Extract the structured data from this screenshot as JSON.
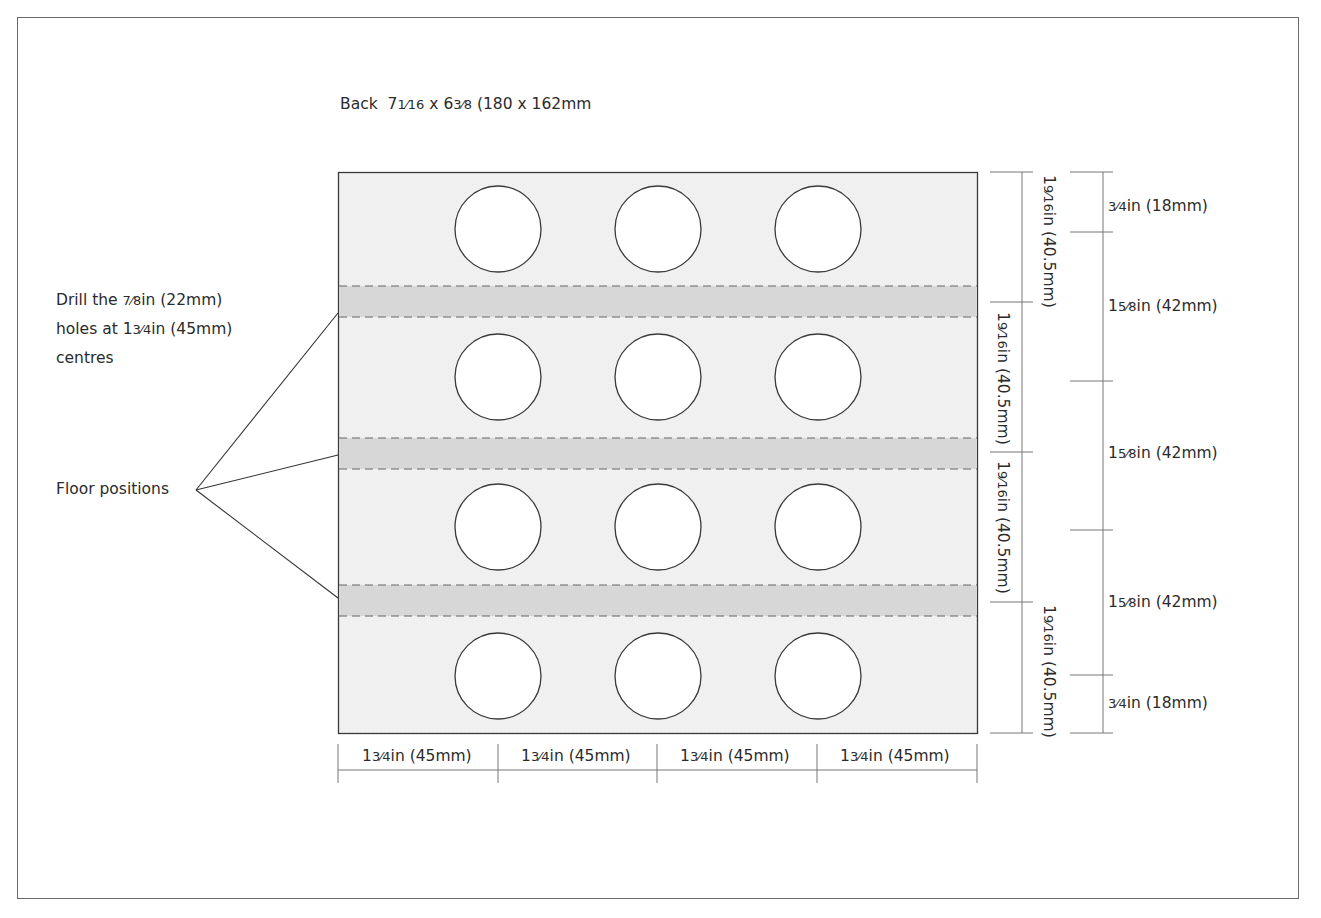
{
  "title": {
    "prefix": "Back",
    "width_in": "7",
    "width_frac": "1⁄16",
    "times": "x",
    "height_in": "6",
    "height_frac": "3⁄8",
    "metric": "(180 x 162mm"
  },
  "annotations": {
    "drill_note": {
      "line1_a": "Drill the ",
      "line1_frac": "7⁄8",
      "line1_b": "in (22mm)",
      "line2_a": "holes at 1",
      "line2_frac": "3⁄4",
      "line2_b": "in (45mm)",
      "line3": "centres"
    },
    "floor_positions": "Floor positions"
  },
  "board": {
    "fill": "#f2f2f2",
    "band_fill": "#d9d9d9",
    "stroke": "#3a3a3a",
    "hole_rows": 4,
    "hole_cols": 3,
    "floor_bands": 3
  },
  "dimensions": {
    "bottom": [
      {
        "whole": "1",
        "frac": "3⁄4",
        "unit": "in (45mm)"
      },
      {
        "whole": "1",
        "frac": "3⁄4",
        "unit": "in (45mm)"
      },
      {
        "whole": "1",
        "frac": "3⁄4",
        "unit": "in (45mm)"
      },
      {
        "whole": "1",
        "frac": "3⁄4",
        "unit": "in (45mm)"
      }
    ],
    "inner_vertical": [
      {
        "whole": "1",
        "frac": "9⁄16",
        "unit": "in (40.5mm)"
      },
      {
        "whole": "1",
        "frac": "9⁄16",
        "unit": "in (40.5mm)"
      },
      {
        "whole": "1",
        "frac": "9⁄16",
        "unit": "in (40.5mm)"
      },
      {
        "whole": "1",
        "frac": "9⁄16",
        "unit": "in (40.5mm)"
      }
    ],
    "outer_vertical": [
      {
        "whole": "",
        "frac": "3⁄4",
        "unit": "in (18mm)"
      },
      {
        "whole": "1",
        "frac": "5⁄8",
        "unit": "in (42mm)"
      },
      {
        "whole": "1",
        "frac": "5⁄8",
        "unit": "in (42mm)"
      },
      {
        "whole": "1",
        "frac": "5⁄8",
        "unit": "in (42mm)"
      },
      {
        "whole": "",
        "frac": "3⁄4",
        "unit": "in (18mm)"
      }
    ]
  }
}
